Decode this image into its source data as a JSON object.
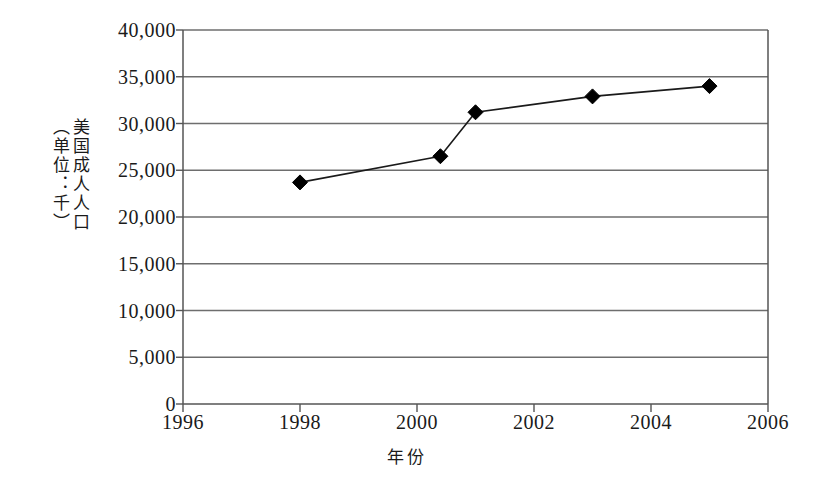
{
  "chart_data": {
    "type": "line",
    "title": "",
    "xlabel": "年份",
    "ylabel": "美国成人人口（单位：千）",
    "ylabel_columns": [
      "美国成人人口",
      "（单位：千）"
    ],
    "xlim": [
      1996,
      2006
    ],
    "ylim": [
      0,
      40000
    ],
    "xticks": [
      1996,
      1998,
      2000,
      2002,
      2004,
      2006
    ],
    "xticklabels": [
      "1996",
      "1998",
      "2000",
      "2002",
      "2004",
      "2006"
    ],
    "yticks": [
      0,
      5000,
      10000,
      15000,
      20000,
      25000,
      30000,
      35000,
      40000
    ],
    "yticklabels": [
      "0",
      "5,000",
      "10,000",
      "15,000",
      "20,000",
      "25,000",
      "30,000",
      "35,000",
      "40,000"
    ],
    "grid": "horizontal",
    "legend": "none",
    "marker": "diamond",
    "series": [
      {
        "name": "美国成人人口",
        "x": [
          1998.0,
          2000.4,
          2001.0,
          2003.0,
          2005.0
        ],
        "values": [
          23700,
          26500,
          31200,
          32900,
          34000
        ]
      }
    ],
    "colors": {
      "line": "#1a1a1a",
      "marker": "#000000",
      "grid": "#6e6e6e",
      "axis": "#555555",
      "background": "#ffffff"
    }
  }
}
